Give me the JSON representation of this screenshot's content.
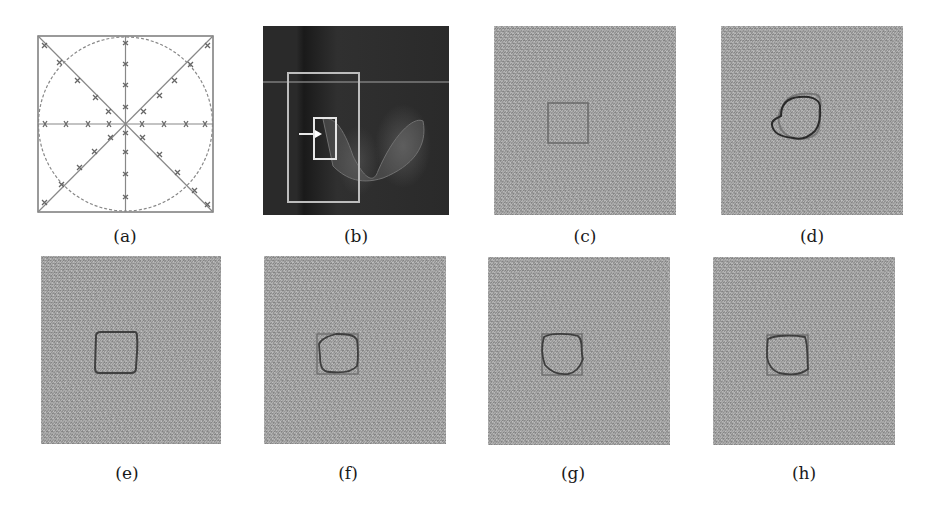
{
  "figure": {
    "panels": [
      {
        "id": "a",
        "label": "(a)",
        "content": "Square domain with inscribed dashed circle and 8 radial lines (horizontal, vertical, two diagonals) marked with x markers"
      },
      {
        "id": "b",
        "label": "(b)",
        "content": "Dark medical image with large outer bounding box, small inner bounding box, and white arrow pointing to it"
      },
      {
        "id": "c",
        "label": "(c)",
        "content": "Noisy gray image with initial square contour"
      },
      {
        "id": "d",
        "label": "(d)",
        "content": "Noisy gray image with two irregular closed contours (dark and gray)"
      },
      {
        "id": "e",
        "label": "(e)",
        "content": "Noisy gray image with rounded-square contour"
      },
      {
        "id": "f",
        "label": "(f)",
        "content": "Noisy gray image with square and irregular contour"
      },
      {
        "id": "g",
        "label": "(g)",
        "content": "Noisy gray image with square and irregular contour"
      },
      {
        "id": "h",
        "label": "(h)",
        "content": "Noisy gray image with square and irregular contour"
      }
    ],
    "colors": {
      "background": "#ffffff",
      "noise_gray": "#a9a9a9",
      "contour_dark": "#2a2a2a",
      "contour_gray": "#6a6a6a",
      "box_light": "#d8d8d8",
      "diagram_line": "#808080"
    }
  }
}
